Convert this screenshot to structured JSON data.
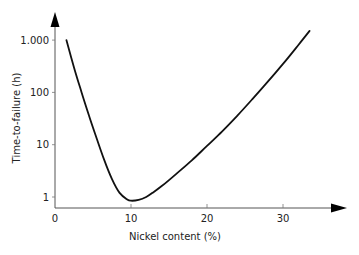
{
  "chart_data": {
    "type": "line",
    "title": "",
    "xlabel": "Nickel content (%)",
    "ylabel": "Time-to-failure (h)",
    "x_scale": "linear",
    "y_scale": "log",
    "xlim": [
      0,
      36
    ],
    "ylim": [
      0.7,
      2000
    ],
    "x_ticks": [
      0,
      10,
      20,
      30
    ],
    "x_tick_labels": [
      "0",
      "10",
      "20",
      "30"
    ],
    "y_ticks": [
      1,
      10,
      100,
      1000
    ],
    "y_tick_labels": [
      "1",
      "10",
      "100",
      "1.000"
    ],
    "grid": false,
    "legend": null,
    "series": [
      {
        "name": "Time-to-failure",
        "x": [
          1.5,
          2.5,
          3.5,
          4.5,
          5.5,
          6.5,
          7.5,
          8.5,
          9.5,
          10,
          11,
          12,
          13,
          14,
          15,
          16,
          18,
          20,
          22,
          24,
          26,
          28,
          30,
          32,
          33.5
        ],
        "y": [
          1000,
          300,
          100,
          35,
          13,
          5,
          2.2,
          1.2,
          0.9,
          0.85,
          0.88,
          1.0,
          1.25,
          1.6,
          2.1,
          2.8,
          5.0,
          9.5,
          18,
          36,
          75,
          160,
          350,
          800,
          1500
        ]
      }
    ],
    "line_color": "#111111",
    "axis_color": "#555555"
  }
}
